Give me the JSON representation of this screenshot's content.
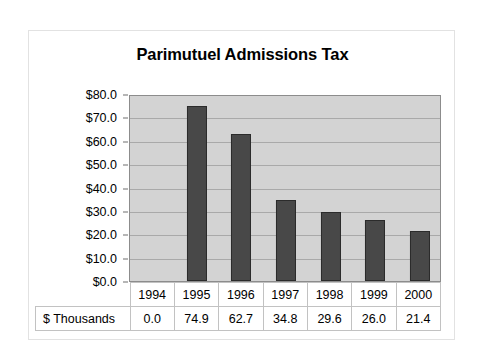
{
  "chart_data": {
    "type": "bar",
    "title": "Parimutuel Admissions Tax",
    "xlabel": "",
    "ylabel": "",
    "categories": [
      "1994",
      "1995",
      "1996",
      "1997",
      "1998",
      "1999",
      "2000"
    ],
    "values": [
      0.0,
      74.9,
      62.7,
      34.8,
      29.6,
      26.0,
      21.4
    ],
    "series": [
      {
        "name": "$ Thousands",
        "values": [
          0.0,
          74.9,
          62.7,
          34.8,
          29.6,
          26.0,
          21.4
        ]
      }
    ],
    "ylim": [
      0,
      80
    ],
    "ytick_values": [
      0,
      10,
      20,
      30,
      40,
      50,
      60,
      70,
      80
    ],
    "ytick_labels": [
      "$0.0",
      "$10.0",
      "$20.0",
      "$30.0",
      "$40.0",
      "$50.0",
      "$60.0",
      "$70.0",
      "$80.0"
    ],
    "grid": true,
    "legend": false,
    "value_format": [
      "0.0",
      "74.9",
      "62.7",
      "34.8",
      "29.6",
      "26.0",
      "21.4"
    ],
    "colors": {
      "bar_fill": "#484848",
      "bar_border": "#2b2b2b",
      "plot_background": "#d3d3d3",
      "gridline": "#a9a9a9",
      "figure_background": "#ffffff",
      "text": "#000000"
    }
  },
  "data_table": {
    "row_header_label": "$ Thousands",
    "year_row": [
      "1994",
      "1995",
      "1996",
      "1997",
      "1998",
      "1999",
      "2000"
    ],
    "value_row": [
      "0.0",
      "74.9",
      "62.7",
      "34.8",
      "29.6",
      "26.0",
      "21.4"
    ]
  }
}
